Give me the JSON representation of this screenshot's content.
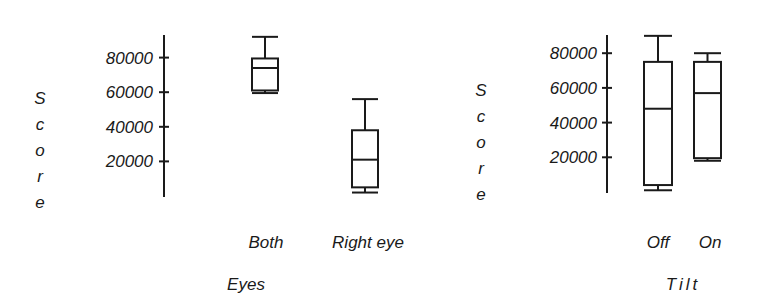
{
  "chart_data": [
    {
      "type": "box",
      "title": "",
      "xlabel": "Eyes",
      "ylabel": "Score",
      "yticks": [
        20000,
        40000,
        60000,
        80000
      ],
      "ytick_labels": [
        "20000",
        "40000",
        "60000",
        "80000"
      ],
      "ylim": [
        0,
        92000
      ],
      "grid": false,
      "categories": [
        "Both",
        "Right eye"
      ],
      "boxes": [
        {
          "category": "Both",
          "min": 59500,
          "q1": 61000,
          "median": 74000,
          "q3": 79500,
          "max": 92000
        },
        {
          "category": "Right eye",
          "min": 2000,
          "q1": 5000,
          "median": 21000,
          "q3": 38000,
          "max": 56000
        }
      ]
    },
    {
      "type": "box",
      "title": "",
      "xlabel": "Tilt",
      "ylabel": "Score",
      "yticks": [
        20000,
        40000,
        60000,
        80000
      ],
      "ytick_labels": [
        "20000",
        "40000",
        "60000",
        "80000"
      ],
      "ylim": [
        0,
        92000
      ],
      "grid": false,
      "categories": [
        "Off",
        "On"
      ],
      "boxes": [
        {
          "category": "Off",
          "min": 1000,
          "q1": 4000,
          "median": 48000,
          "q3": 75000,
          "max": 90000
        },
        {
          "category": "On",
          "min": 18000,
          "q1": 19500,
          "median": 57000,
          "q3": 75000,
          "max": 80000
        }
      ]
    }
  ],
  "colors": {
    "ink": "#1a1a1a",
    "background": "#ffffff"
  }
}
